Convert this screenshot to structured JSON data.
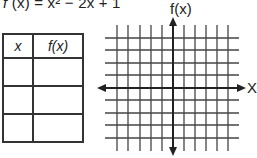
{
  "equation": {
    "prefix": "f",
    "arg": "(x)",
    "rest": " = x² − 2x + 1"
  },
  "table": {
    "headers": [
      "x",
      "f(x)"
    ],
    "rows": [
      [
        "",
        ""
      ],
      [
        "",
        ""
      ],
      [
        "",
        ""
      ]
    ]
  },
  "graph": {
    "y_axis_label": "f(x)",
    "x_axis_label": "X",
    "grid_vertical_lines": 11,
    "grid_horizontal_lines": 9
  }
}
